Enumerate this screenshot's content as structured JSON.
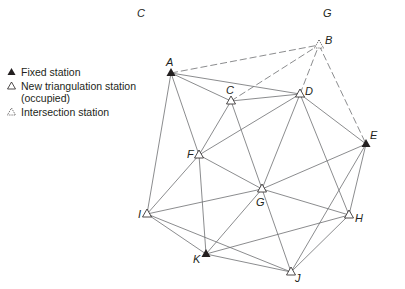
{
  "header": {
    "left_label": "C",
    "right_label": "G"
  },
  "legend": {
    "items": [
      {
        "symbol": "filled-triangle",
        "label": "Fixed station"
      },
      {
        "symbol": "open-triangle",
        "label": "New triangulation station",
        "label2": "(occupied)"
      },
      {
        "symbol": "dotted-triangle",
        "label": "Intersection station"
      }
    ]
  },
  "stations": [
    {
      "id": "A",
      "x": 171,
      "y": 73,
      "type": "fixed",
      "lx": 166,
      "ly": 66
    },
    {
      "id": "B",
      "x": 319,
      "y": 45,
      "type": "intersection",
      "lx": 325,
      "ly": 44
    },
    {
      "id": "C",
      "x": 231,
      "y": 101,
      "type": "new",
      "lx": 226,
      "ly": 94
    },
    {
      "id": "D",
      "x": 300,
      "y": 94,
      "type": "new",
      "lx": 305,
      "ly": 95
    },
    {
      "id": "E",
      "x": 366,
      "y": 144,
      "type": "fixed",
      "lx": 370,
      "ly": 139
    },
    {
      "id": "F",
      "x": 199,
      "y": 155,
      "type": "new",
      "lx": 187,
      "ly": 158
    },
    {
      "id": "G",
      "x": 262,
      "y": 189,
      "type": "new",
      "lx": 256,
      "ly": 206
    },
    {
      "id": "H",
      "x": 349,
      "y": 215,
      "type": "new",
      "lx": 355,
      "ly": 222
    },
    {
      "id": "I",
      "x": 147,
      "y": 214,
      "type": "new",
      "lx": 138,
      "ly": 218
    },
    {
      "id": "J",
      "x": 291,
      "y": 272,
      "type": "new",
      "lx": 295,
      "ly": 282
    },
    {
      "id": "K",
      "x": 206,
      "y": 254,
      "type": "fixed",
      "lx": 193,
      "ly": 263
    }
  ],
  "observations": [
    {
      "from": "A",
      "to": "B",
      "style": "dashed"
    },
    {
      "from": "A",
      "to": "C",
      "style": "solid"
    },
    {
      "from": "A",
      "to": "D",
      "style": "solid"
    },
    {
      "from": "A",
      "to": "F",
      "style": "solid"
    },
    {
      "from": "A",
      "to": "I",
      "style": "solid"
    },
    {
      "from": "C",
      "to": "B",
      "style": "dashed"
    },
    {
      "from": "C",
      "to": "D",
      "style": "solid"
    },
    {
      "from": "C",
      "to": "F",
      "style": "solid"
    },
    {
      "from": "C",
      "to": "G",
      "style": "solid"
    },
    {
      "from": "D",
      "to": "B",
      "style": "dashed"
    },
    {
      "from": "D",
      "to": "F",
      "style": "solid"
    },
    {
      "from": "D",
      "to": "G",
      "style": "solid"
    },
    {
      "from": "D",
      "to": "H",
      "style": "solid"
    },
    {
      "from": "D",
      "to": "E",
      "style": "solid"
    },
    {
      "from": "B",
      "to": "E",
      "style": "dashed"
    },
    {
      "from": "E",
      "to": "G",
      "style": "solid"
    },
    {
      "from": "E",
      "to": "H",
      "style": "solid"
    },
    {
      "from": "E",
      "to": "J",
      "style": "solid"
    },
    {
      "from": "F",
      "to": "I",
      "style": "solid"
    },
    {
      "from": "F",
      "to": "G",
      "style": "solid"
    },
    {
      "from": "F",
      "to": "K",
      "style": "solid"
    },
    {
      "from": "G",
      "to": "I",
      "style": "solid"
    },
    {
      "from": "G",
      "to": "H",
      "style": "solid"
    },
    {
      "from": "G",
      "to": "K",
      "style": "solid"
    },
    {
      "from": "G",
      "to": "J",
      "style": "solid"
    },
    {
      "from": "H",
      "to": "K",
      "style": "solid"
    },
    {
      "from": "H",
      "to": "J",
      "style": "solid"
    },
    {
      "from": "I",
      "to": "K",
      "style": "solid"
    },
    {
      "from": "I",
      "to": "J",
      "style": "solid"
    },
    {
      "from": "K",
      "to": "J",
      "style": "solid"
    }
  ],
  "colors": {
    "line": "#6d6e71",
    "ink": "#231f20"
  }
}
